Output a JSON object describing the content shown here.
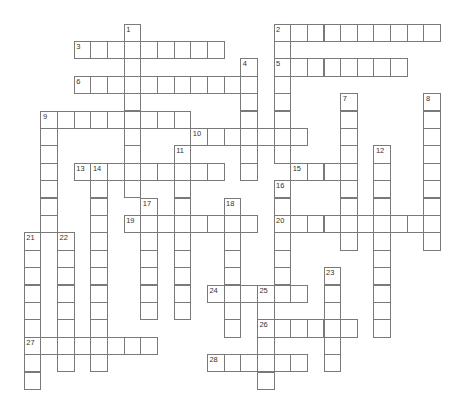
{
  "puzzle": {
    "type": "crossword",
    "grid_line_color": "#7a7a7a",
    "cell_fill": "#ffffff",
    "background": "#ffffff",
    "layout": {
      "origin_x": 24.3,
      "origin_y": 24,
      "col_pitch": 16.65,
      "row_pitch": 17.4
    },
    "across": [
      {
        "number": "2",
        "col": 15,
        "row": 0,
        "length": 10
      },
      {
        "number": "3",
        "col": 3,
        "row": 1,
        "length": 9
      },
      {
        "number": "5",
        "col": 15,
        "row": 2,
        "length": 8
      },
      {
        "number": "6",
        "col": 3,
        "row": 3,
        "length": 11
      },
      {
        "number": "9",
        "col": 1,
        "row": 5,
        "length": 9
      },
      {
        "number": "10",
        "col": 10,
        "row": 6,
        "length": 7
      },
      {
        "number": "13",
        "col": 3,
        "row": 8,
        "length": 9
      },
      {
        "number": "15",
        "col": 16,
        "row": 8,
        "length": 4
      },
      {
        "number": "19",
        "col": 6,
        "row": 11,
        "length": 8
      },
      {
        "number": "20",
        "col": 15,
        "row": 11,
        "length": 10
      },
      {
        "number": "24",
        "col": 11,
        "row": 15,
        "length": 6
      },
      {
        "number": "26",
        "col": 14,
        "row": 17,
        "length": 6
      },
      {
        "number": "27",
        "col": 0,
        "row": 18,
        "length": 8
      },
      {
        "number": "28",
        "col": 11,
        "row": 19,
        "length": 6
      }
    ],
    "down": [
      {
        "number": "1",
        "col": 6,
        "row": 0,
        "length": 10
      },
      {
        "number": "2",
        "col": 15,
        "row": 0,
        "length": 8
      },
      {
        "number": "4",
        "col": 13,
        "row": 2,
        "length": 7
      },
      {
        "number": "7",
        "col": 19,
        "row": 4,
        "length": 9
      },
      {
        "number": "8",
        "col": 24,
        "row": 4,
        "length": 9
      },
      {
        "number": "9",
        "col": 1,
        "row": 5,
        "length": 7
      },
      {
        "number": "11",
        "col": 9,
        "row": 7,
        "length": 10
      },
      {
        "number": "12",
        "col": 21,
        "row": 7,
        "length": 11
      },
      {
        "number": "14",
        "col": 4,
        "row": 8,
        "length": 12
      },
      {
        "number": "16",
        "col": 15,
        "row": 9,
        "length": 7
      },
      {
        "number": "17",
        "col": 7,
        "row": 10,
        "length": 7
      },
      {
        "number": "18",
        "col": 12,
        "row": 10,
        "length": 8
      },
      {
        "number": "21",
        "col": 0,
        "row": 12,
        "length": 9
      },
      {
        "number": "22",
        "col": 2,
        "row": 12,
        "length": 8
      },
      {
        "number": "23",
        "col": 18,
        "row": 14,
        "length": 6
      },
      {
        "number": "25",
        "col": 14,
        "row": 15,
        "length": 6
      }
    ],
    "numbers": [
      {
        "label": "1",
        "col": 6,
        "row": 0
      },
      {
        "label": "2",
        "col": 15,
        "row": 0
      },
      {
        "label": "3",
        "col": 3,
        "row": 1
      },
      {
        "label": "4",
        "col": 13,
        "row": 2
      },
      {
        "label": "5",
        "col": 15,
        "row": 2
      },
      {
        "label": "6",
        "col": 3,
        "row": 3
      },
      {
        "label": "7",
        "col": 19,
        "row": 4
      },
      {
        "label": "8",
        "col": 24,
        "row": 4
      },
      {
        "label": "9",
        "col": 1,
        "row": 5
      },
      {
        "label": "10",
        "col": 10,
        "row": 6
      },
      {
        "label": "11",
        "col": 9,
        "row": 7
      },
      {
        "label": "12",
        "col": 21,
        "row": 7
      },
      {
        "label": "13",
        "col": 3,
        "row": 8
      },
      {
        "label": "14",
        "col": 4,
        "row": 8
      },
      {
        "label": "15",
        "col": 16,
        "row": 8
      },
      {
        "label": "16",
        "col": 15,
        "row": 9
      },
      {
        "label": "17",
        "col": 7,
        "row": 10
      },
      {
        "label": "18",
        "col": 12,
        "row": 10
      },
      {
        "label": "19",
        "col": 6,
        "row": 11
      },
      {
        "label": "20",
        "col": 15,
        "row": 11
      },
      {
        "label": "21",
        "col": 0,
        "row": 12
      },
      {
        "label": "22",
        "col": 2,
        "row": 12
      },
      {
        "label": "23",
        "col": 18,
        "row": 14
      },
      {
        "label": "24",
        "col": 11,
        "row": 15
      },
      {
        "label": "25",
        "col": 14,
        "row": 15
      },
      {
        "label": "26",
        "col": 14,
        "row": 17
      },
      {
        "label": "27",
        "col": 0,
        "row": 18
      },
      {
        "label": "28",
        "col": 11,
        "row": 19
      }
    ]
  }
}
